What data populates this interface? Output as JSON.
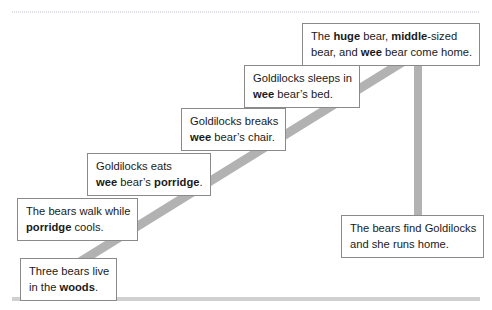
{
  "diagram": {
    "type": "story-sequence-timeline",
    "colors": {
      "stroke": "#b2b2b2",
      "box_border": "#8a8a8a",
      "box_fill": "#ffffff",
      "text": "#1a1a1a",
      "rule": "#c8c8c8"
    },
    "strokes": [
      {
        "name": "diagonal-timeline",
        "from": [
          70,
          268
        ],
        "to": [
          422,
          50
        ]
      },
      {
        "name": "vertical-drop",
        "from": [
          418,
          52
        ],
        "to": [
          418,
          215
        ]
      }
    ],
    "events": [
      {
        "id": "woods",
        "order": 1,
        "name": "event-three-bears-live-in-woods",
        "lines": [
          [
            {
              "t": "Three bears live",
              "b": false
            }
          ],
          [
            {
              "t": "in the ",
              "b": false
            },
            {
              "t": "woods",
              "b": true
            },
            {
              "t": ".",
              "b": false
            }
          ]
        ]
      },
      {
        "id": "cools",
        "order": 2,
        "name": "event-bears-walk-while-porridge-cools",
        "lines": [
          [
            {
              "t": "The bears walk while",
              "b": false
            }
          ],
          [
            {
              "t": "porridge",
              "b": true
            },
            {
              "t": " cools.",
              "b": false
            }
          ]
        ]
      },
      {
        "id": "porridge",
        "order": 3,
        "name": "event-goldilocks-eats-porridge",
        "lines": [
          [
            {
              "t": "Goldilocks eats",
              "b": false
            }
          ],
          [
            {
              "t": "wee",
              "b": true
            },
            {
              "t": " bear’s ",
              "b": false
            },
            {
              "t": "porridge",
              "b": true
            },
            {
              "t": ".",
              "b": false
            }
          ]
        ]
      },
      {
        "id": "chair",
        "order": 4,
        "name": "event-goldilocks-breaks-chair",
        "lines": [
          [
            {
              "t": "Goldilocks breaks",
              "b": false
            }
          ],
          [
            {
              "t": "wee",
              "b": true
            },
            {
              "t": " bear’s chair.",
              "b": false
            }
          ]
        ]
      },
      {
        "id": "sleeps",
        "order": 5,
        "name": "event-goldilocks-sleeps-in-bed",
        "lines": [
          [
            {
              "t": "Goldilocks sleeps in",
              "b": false
            }
          ],
          [
            {
              "t": "wee",
              "b": true
            },
            {
              "t": " bear’s bed.",
              "b": false
            }
          ]
        ]
      },
      {
        "id": "home",
        "order": 6,
        "name": "event-bears-come-home",
        "lines": [
          [
            {
              "t": "The ",
              "b": false
            },
            {
              "t": "huge",
              "b": true
            },
            {
              "t": " bear, ",
              "b": false
            },
            {
              "t": "middle",
              "b": true
            },
            {
              "t": "-sized",
              "b": false
            }
          ],
          [
            {
              "t": "bear, and ",
              "b": false
            },
            {
              "t": "wee",
              "b": true
            },
            {
              "t": " bear come home.",
              "b": false
            }
          ]
        ]
      },
      {
        "id": "find",
        "order": 7,
        "name": "event-bears-find-goldilocks",
        "lines": [
          [
            {
              "t": "The bears find Goldilocks",
              "b": false
            }
          ],
          [
            {
              "t": "and she runs home.",
              "b": false
            }
          ]
        ]
      }
    ]
  }
}
